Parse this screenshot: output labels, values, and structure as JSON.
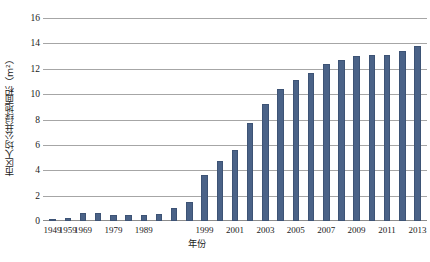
{
  "chart_data": {
    "type": "bar",
    "title": "",
    "xlabel": "年份",
    "ylabel": "市区人均公共绿地面积（m²）",
    "categories": [
      "1949",
      "1959",
      "1969",
      "1974",
      "1979",
      "1984",
      "1989",
      "1994",
      "1997",
      "1998",
      "1999",
      "2000",
      "2001",
      "2002",
      "2003",
      "2004",
      "2005",
      "2006",
      "2007",
      "2008",
      "2009",
      "2010",
      "2011",
      "2012",
      "2013"
    ],
    "values": [
      0.1,
      0.2,
      0.6,
      0.6,
      0.5,
      0.45,
      0.5,
      0.55,
      1.0,
      1.5,
      3.6,
      4.7,
      5.6,
      7.7,
      9.2,
      10.4,
      11.1,
      11.7,
      12.4,
      12.7,
      13.0,
      13.1,
      13.1,
      13.4,
      13.8
    ],
    "ylim": [
      0,
      16
    ],
    "yticks": [
      0,
      2,
      4,
      6,
      8,
      10,
      12,
      14,
      16
    ],
    "xtick_labels": [
      "1949",
      "1959",
      "1969",
      "1979",
      "1989",
      "1999",
      "2001",
      "2003",
      "2005",
      "2007",
      "2009",
      "2011",
      "2013"
    ],
    "xtick_indices": [
      0,
      1,
      2,
      4,
      6,
      10,
      12,
      14,
      16,
      18,
      20,
      22,
      24
    ],
    "grid": true,
    "legend": false,
    "bar_color": "#4a6287",
    "grid_color": "#a6a6a6",
    "axis_color": "#8c8c8c"
  }
}
